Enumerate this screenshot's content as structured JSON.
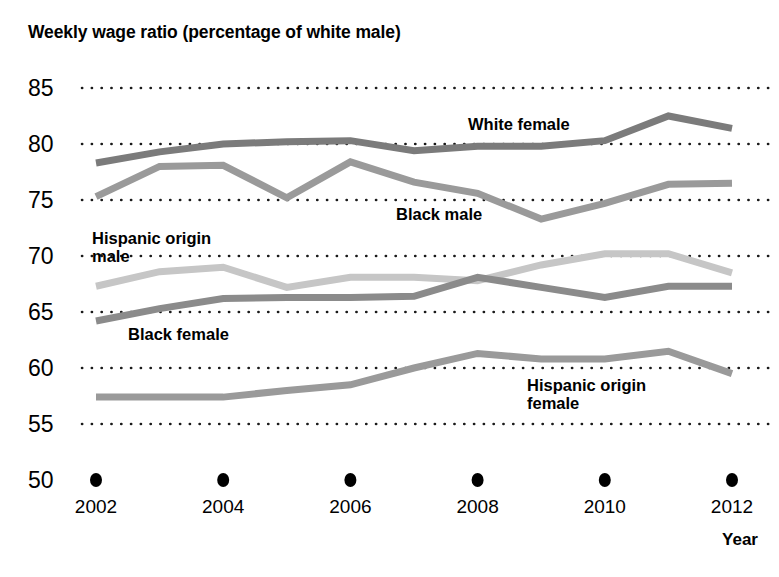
{
  "chart_data": {
    "type": "line",
    "title": "Weekly wage ratio (percentage of white male)",
    "xlabel": "Year",
    "ylabel": "",
    "x": [
      2002,
      2003,
      2004,
      2005,
      2006,
      2007,
      2008,
      2009,
      2010,
      2011,
      2012
    ],
    "xtick_labels": [
      "2002",
      "2004",
      "2006",
      "2008",
      "2010",
      "2012"
    ],
    "xticks": [
      2002,
      2004,
      2006,
      2008,
      2010,
      2012
    ],
    "ytick_labels": [
      "50",
      "55",
      "60",
      "65",
      "70",
      "75",
      "80",
      "85"
    ],
    "yticks": [
      50,
      55,
      60,
      65,
      70,
      75,
      80,
      85
    ],
    "ylim": [
      50,
      85
    ],
    "xlim": [
      2002,
      2012
    ],
    "grid": "horizontal-dotted",
    "legend": "inline-annotations",
    "series": [
      {
        "name": "White female",
        "color": "#7b7b7b",
        "values": [
          78.3,
          79.3,
          80.0,
          80.2,
          80.3,
          79.4,
          79.8,
          79.8,
          80.3,
          82.5,
          81.4
        ],
        "label_x": 468,
        "label_y": 115
      },
      {
        "name": "Black male",
        "color": "#9a9a9a",
        "values": [
          75.3,
          78.0,
          78.1,
          75.2,
          78.4,
          76.6,
          75.6,
          73.3,
          74.7,
          76.4,
          76.5
        ],
        "label_x": 396,
        "label_y": 205
      },
      {
        "name": "Hispanic origin male",
        "color": "#c6c6c6",
        "values": [
          67.3,
          68.6,
          69.0,
          67.2,
          68.1,
          68.1,
          67.8,
          69.2,
          70.2,
          70.2,
          68.5
        ],
        "label_x": 92,
        "label_y": 229
      },
      {
        "name": "Black female",
        "color": "#8b8b8b",
        "values": [
          64.2,
          65.3,
          66.2,
          66.3,
          66.3,
          66.4,
          68.1,
          67.2,
          66.3,
          67.3,
          67.3
        ],
        "label_x": 128,
        "label_y": 325
      },
      {
        "name": "Hispanic origin female",
        "color": "#9a9a9a",
        "values": [
          57.4,
          57.4,
          57.4,
          58.0,
          58.5,
          60.0,
          61.3,
          60.8,
          60.8,
          61.5,
          59.5
        ],
        "label_x": 527,
        "label_y": 376
      }
    ]
  }
}
